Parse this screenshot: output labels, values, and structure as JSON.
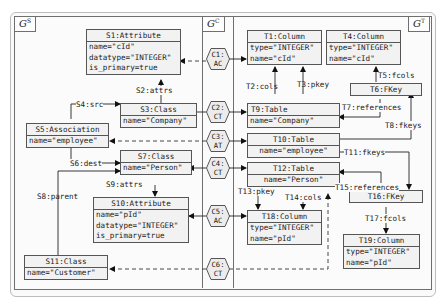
{
  "graphs": {
    "source": {
      "label": "G",
      "sup": "S"
    },
    "correspondence": {
      "label": "G",
      "sup": "C"
    },
    "target": {
      "label": "G",
      "sup": "T"
    }
  },
  "source_nodes": {
    "s1": {
      "title": "S1:Attribute",
      "attrs": [
        "name=\"cId\"",
        "datatype=\"INTEGER\"",
        "is_primary=true"
      ]
    },
    "s3": {
      "title": "S3:Class",
      "attrs": [
        "name=\"Company\""
      ]
    },
    "s5": {
      "title": "S5:Association",
      "attrs": [
        "name=\"employee\""
      ]
    },
    "s7": {
      "title": "S7:Class",
      "attrs": [
        "name=\"Person\""
      ]
    },
    "s10": {
      "title": "S10:Attribute",
      "attrs": [
        "name=\"pId\"",
        "datatype=\"INTEGER\"",
        "is_primary=true"
      ]
    },
    "s11": {
      "title": "S11:Class",
      "attrs": [
        "name=\"Customer\""
      ]
    }
  },
  "source_edges": {
    "s2": "S2:attrs",
    "s4": "S4:src",
    "s6": "S6:dest",
    "s8": "S8:parent",
    "s9": "S9:attrs"
  },
  "corr_nodes": {
    "c1": {
      "id": "C1:",
      "type": "AC"
    },
    "c2": {
      "id": "C2:",
      "type": "CT"
    },
    "c3": {
      "id": "C3:",
      "type": "AT"
    },
    "c4": {
      "id": "C4:",
      "type": "CT"
    },
    "c5": {
      "id": "C5:",
      "type": "AC"
    },
    "c6": {
      "id": "C6:",
      "type": "CT"
    }
  },
  "target_nodes": {
    "t1": {
      "title": "T1:Column",
      "attrs": [
        "type=\"INTEGER\"",
        "name=\"cId\""
      ]
    },
    "t4": {
      "title": "T4:Column",
      "attrs": [
        "type=\"INTEGER\"",
        "name=\"cId\""
      ]
    },
    "t6": {
      "title": "T6:FKey",
      "attrs": []
    },
    "t9": {
      "title": "T9:Table",
      "attrs": [
        "name=\"Company\""
      ]
    },
    "t10": {
      "title": "T10:Table",
      "attrs": [
        "name=\"employee\""
      ]
    },
    "t12": {
      "title": "T12:Table",
      "attrs": [
        "name=\"Person\""
      ]
    },
    "t16": {
      "title": "T16:FKey",
      "attrs": []
    },
    "t18": {
      "title": "T18:Column",
      "attrs": [
        "type=\"INTEGER\"",
        "name=\"pId\""
      ]
    },
    "t19": {
      "title": "T19:Column",
      "attrs": [
        "type=\"INTEGER\"",
        "name=\"pId\""
      ]
    }
  },
  "target_edges": {
    "t2": "T2:cols",
    "t3": "T3:pkey",
    "t5": "T5:fcols",
    "t7": "T7:references",
    "t8": "T8:fkeys",
    "t11": "T11:fkeys",
    "t13": "T13:pkey",
    "t14": "T14:cols",
    "t15": "T15:references",
    "t17": "T17:fcols"
  }
}
